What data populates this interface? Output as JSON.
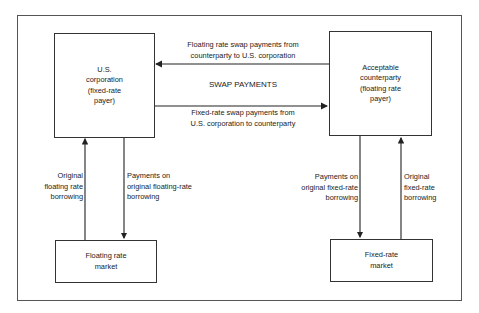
{
  "diagram": {
    "title_center": "SWAP PAYMENTS",
    "nodes": {
      "us_corp": {
        "lines": [
          "U.S.",
          "corporation",
          "(fixed-rate",
          "payer)"
        ]
      },
      "counterparty": {
        "lines": [
          "Acceptable",
          "counterparty",
          "(floating rate",
          "payer)"
        ]
      },
      "floating_market": {
        "lines": [
          "Floating rate",
          "market"
        ]
      },
      "fixed_market": {
        "lines": [
          "Fixed-rate",
          "market"
        ]
      }
    },
    "edges": {
      "floating_swap": {
        "lines": [
          "Floating rate swap payments from",
          "counterparty to U.S. corporation"
        ]
      },
      "fixed_swap": {
        "lines": [
          "Fixed-rate swap payments from",
          "U.S. corporation to counterparty"
        ]
      },
      "orig_floating_borrowing": {
        "lines": [
          "Original",
          "floating rate",
          "borrowing"
        ]
      },
      "payments_floating": {
        "lines": [
          "Payments on",
          "original floating-rate",
          "borrowing"
        ]
      },
      "payments_fixed": {
        "lines": [
          "Payments on",
          "original fixed-rate",
          "borrowing"
        ]
      },
      "orig_fixed_borrowing": {
        "lines": [
          "Original",
          "fixed-rate",
          "borrowing"
        ]
      }
    }
  }
}
